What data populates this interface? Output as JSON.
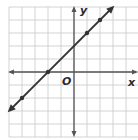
{
  "chart_data": {
    "type": "line",
    "title": "",
    "xlabel": "x",
    "ylabel": "y",
    "origin_label": "O",
    "grid": true,
    "xlim": [
      -5,
      5
    ],
    "ylim": [
      -5,
      5
    ],
    "series": [
      {
        "name": "line",
        "equation": "y = x + 2",
        "points": [
          [
            -4,
            -2
          ],
          [
            -2,
            0
          ],
          [
            1,
            3
          ],
          [
            2,
            4
          ]
        ],
        "arrows": "both"
      }
    ]
  },
  "labels": {
    "x_axis": "x",
    "y_axis": "y",
    "origin": "O"
  },
  "colors": {
    "grid": "#c8c8c8",
    "axis": "#555555",
    "line": "#333333",
    "background": "#ffffff"
  }
}
